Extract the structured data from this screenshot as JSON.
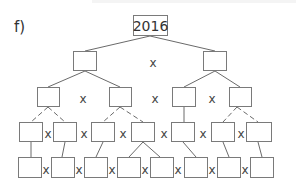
{
  "problem_label": "f)",
  "root": {
    "value": "2016"
  },
  "operator": "x",
  "levels": [
    {
      "level": 0,
      "boxes": [
        {
          "x": 133,
          "y": 15,
          "w": 35,
          "h": 21,
          "value": "2016"
        }
      ]
    },
    {
      "level": 1,
      "boxes": [
        {
          "x": 73,
          "y": 51,
          "w": 24,
          "h": 20,
          "value": ""
        },
        {
          "x": 203,
          "y": 51,
          "w": 24,
          "h": 20,
          "value": ""
        }
      ]
    },
    {
      "level": 2,
      "boxes": [
        {
          "x": 37,
          "y": 87,
          "w": 23,
          "h": 20,
          "value": ""
        },
        {
          "x": 109,
          "y": 87,
          "w": 23,
          "h": 20,
          "value": ""
        },
        {
          "x": 172,
          "y": 87,
          "w": 24,
          "h": 20,
          "value": ""
        },
        {
          "x": 229,
          "y": 87,
          "w": 23,
          "h": 20,
          "value": ""
        }
      ]
    },
    {
      "level": 3,
      "boxes": [
        {
          "x": 19,
          "y": 122,
          "w": 24,
          "h": 20,
          "value": ""
        },
        {
          "x": 53,
          "y": 122,
          "w": 24,
          "h": 20,
          "value": ""
        },
        {
          "x": 91,
          "y": 122,
          "w": 24,
          "h": 20,
          "value": ""
        },
        {
          "x": 131,
          "y": 122,
          "w": 24,
          "h": 20,
          "value": ""
        },
        {
          "x": 171,
          "y": 122,
          "w": 24,
          "h": 20,
          "value": ""
        },
        {
          "x": 211,
          "y": 122,
          "w": 24,
          "h": 20,
          "value": ""
        },
        {
          "x": 246,
          "y": 122,
          "w": 26,
          "h": 20,
          "value": ""
        }
      ]
    },
    {
      "level": 4,
      "boxes": [
        {
          "x": 18,
          "y": 157,
          "w": 24,
          "h": 21,
          "value": ""
        },
        {
          "x": 51,
          "y": 157,
          "w": 24,
          "h": 21,
          "value": ""
        },
        {
          "x": 84,
          "y": 157,
          "w": 24,
          "h": 21,
          "value": ""
        },
        {
          "x": 117,
          "y": 157,
          "w": 24,
          "h": 21,
          "value": ""
        },
        {
          "x": 150,
          "y": 157,
          "w": 24,
          "h": 21,
          "value": ""
        },
        {
          "x": 184,
          "y": 157,
          "w": 24,
          "h": 21,
          "value": ""
        },
        {
          "x": 217,
          "y": 157,
          "w": 24,
          "h": 21,
          "value": ""
        },
        {
          "x": 250,
          "y": 157,
          "w": 24,
          "h": 21,
          "value": ""
        }
      ]
    }
  ],
  "operators": [
    {
      "x": 153,
      "y": 63,
      "text": "x"
    },
    {
      "x": 83,
      "y": 99,
      "text": "x"
    },
    {
      "x": 155,
      "y": 99,
      "text": "x"
    },
    {
      "x": 212,
      "y": 99,
      "text": "x"
    },
    {
      "x": 48,
      "y": 134,
      "text": "x"
    },
    {
      "x": 84,
      "y": 134,
      "text": "x"
    },
    {
      "x": 123,
      "y": 134,
      "text": "x"
    },
    {
      "x": 164,
      "y": 134,
      "text": "x"
    },
    {
      "x": 203,
      "y": 134,
      "text": "x"
    },
    {
      "x": 241,
      "y": 134,
      "text": "x"
    },
    {
      "x": 46,
      "y": 170,
      "text": "x"
    },
    {
      "x": 79,
      "y": 170,
      "text": "x"
    },
    {
      "x": 112,
      "y": 170,
      "text": "x"
    },
    {
      "x": 145,
      "y": 170,
      "text": "x"
    },
    {
      "x": 178,
      "y": 170,
      "text": "x"
    },
    {
      "x": 212,
      "y": 170,
      "text": "x"
    },
    {
      "x": 245,
      "y": 170,
      "text": "x"
    }
  ],
  "edges": [
    {
      "x1": 150,
      "y1": 36,
      "x2": 85,
      "y2": 51,
      "style": "solid"
    },
    {
      "x1": 150,
      "y1": 36,
      "x2": 215,
      "y2": 51,
      "style": "solid"
    },
    {
      "x1": 85,
      "y1": 71,
      "x2": 48,
      "y2": 87,
      "style": "solid"
    },
    {
      "x1": 85,
      "y1": 71,
      "x2": 120,
      "y2": 87,
      "style": "solid"
    },
    {
      "x1": 215,
      "y1": 71,
      "x2": 184,
      "y2": 87,
      "style": "solid"
    },
    {
      "x1": 215,
      "y1": 71,
      "x2": 240,
      "y2": 87,
      "style": "solid"
    },
    {
      "x1": 48,
      "y1": 107,
      "x2": 31,
      "y2": 122,
      "style": "dashed"
    },
    {
      "x1": 48,
      "y1": 107,
      "x2": 65,
      "y2": 122,
      "style": "dashed"
    },
    {
      "x1": 120,
      "y1": 107,
      "x2": 103,
      "y2": 122,
      "style": "dashed"
    },
    {
      "x1": 120,
      "y1": 107,
      "x2": 143,
      "y2": 122,
      "style": "dashed"
    },
    {
      "x1": 184,
      "y1": 107,
      "x2": 184,
      "y2": 122,
      "style": "solid"
    },
    {
      "x1": 237,
      "y1": 107,
      "x2": 223,
      "y2": 122,
      "style": "dashed"
    },
    {
      "x1": 237,
      "y1": 107,
      "x2": 258,
      "y2": 122,
      "style": "dashed"
    },
    {
      "x1": 31,
      "y1": 142,
      "x2": 31,
      "y2": 157,
      "style": "solid"
    },
    {
      "x1": 65,
      "y1": 142,
      "x2": 62,
      "y2": 157,
      "style": "solid"
    },
    {
      "x1": 103,
      "y1": 142,
      "x2": 96,
      "y2": 157,
      "style": "solid"
    },
    {
      "x1": 143,
      "y1": 142,
      "x2": 129,
      "y2": 157,
      "style": "solid"
    },
    {
      "x1": 143,
      "y1": 142,
      "x2": 160,
      "y2": 157,
      "style": "solid"
    },
    {
      "x1": 183,
      "y1": 142,
      "x2": 196,
      "y2": 157,
      "style": "solid"
    },
    {
      "x1": 223,
      "y1": 142,
      "x2": 229,
      "y2": 157,
      "style": "solid"
    },
    {
      "x1": 258,
      "y1": 142,
      "x2": 262,
      "y2": 157,
      "style": "solid"
    }
  ]
}
